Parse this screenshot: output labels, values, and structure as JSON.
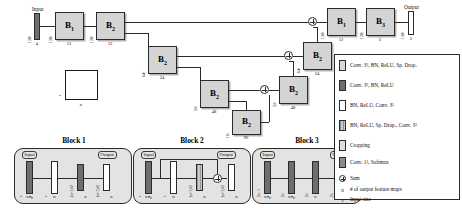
{
  "diagram": {
    "input_label": "Input",
    "output_label": "Output",
    "scale_box": {
      "size_label": "s",
      "maps_label": "n"
    }
  },
  "encoder": {
    "input_bar": {
      "size": "128³",
      "maps": "4"
    },
    "nodes": [
      {
        "name": "B",
        "sub": "1",
        "size": "128³",
        "maps": "12"
      },
      {
        "name": "B",
        "sub": "2",
        "size": "128³",
        "maps": "12"
      },
      {
        "name": "B",
        "sub": "2",
        "size": "64³",
        "maps": "24"
      },
      {
        "name": "B",
        "sub": "2",
        "size": "32³",
        "maps": "48"
      },
      {
        "name": "B",
        "sub": "2",
        "size": "16³",
        "maps": "96"
      }
    ]
  },
  "decoder": {
    "nodes": [
      {
        "name": "B",
        "sub": "2",
        "size": "32³",
        "maps": "48"
      },
      {
        "name": "B",
        "sub": "2",
        "size": "64³",
        "maps": "24"
      },
      {
        "name": "B",
        "sub": "1",
        "size": "128³",
        "maps": "12"
      },
      {
        "name": "B",
        "sub": "3",
        "size": "128³",
        "maps": "2"
      }
    ],
    "output_bar": {
      "size": "128³",
      "maps": "2"
    }
  },
  "blocks": [
    {
      "title": "Block 1",
      "input_tag": "Input",
      "output_tag": "Output",
      "bars": [
        {
          "style": "dark",
          "size": "s",
          "maps": "nₙₚ"
        },
        {
          "style": "white",
          "size": "s",
          "maps": "n"
        },
        {
          "style": "dark",
          "size": "(s+1)/2",
          "maps": "n"
        },
        {
          "style": "white",
          "size": "(s+1)/2",
          "maps": "n"
        }
      ],
      "has_skip": false,
      "has_sum": false
    },
    {
      "title": "Block 2",
      "input_tag": "Input",
      "output_tag": "Output",
      "bars": [
        {
          "style": "dark",
          "size": "s",
          "maps": "nₙₚ"
        },
        {
          "style": "white",
          "size": "s",
          "maps": "n"
        },
        {
          "style": "hatch",
          "size": "(s+1)/2",
          "maps": "n"
        },
        {
          "style": "white",
          "size": "(s+1)/2",
          "maps": "n"
        }
      ],
      "has_skip": true,
      "has_sum": true
    },
    {
      "title": "Block 3",
      "input_tag": "Input",
      "output_tag": "Output",
      "bars": [
        {
          "style": "dark",
          "size": "2s−1",
          "maps": "nₙₚ"
        },
        {
          "style": "dark",
          "size": "2s",
          "maps": "nₙₚ"
        },
        {
          "style": "dark",
          "size": "2s",
          "maps": "n"
        },
        {
          "style": "white",
          "size": "2s",
          "maps": "n"
        }
      ],
      "has_skip": false,
      "has_sum": false
    }
  ],
  "legend": {
    "items": [
      {
        "swatch": "l1",
        "text": "Conv. 3³, BN, ReLU, Sp. Drop."
      },
      {
        "swatch": "l2",
        "text": "Conv. 3³, BN, ReLU"
      },
      {
        "swatch": "l3",
        "text": "BN, ReLU, Conv. 3³"
      },
      {
        "swatch": "l4",
        "text": "BN, ReLU, Sp. Drop., Conv. 3³"
      },
      {
        "swatch": "l5",
        "text": "Cropping"
      },
      {
        "swatch": "l6",
        "text": "Conv. 1³, Softmax"
      }
    ],
    "sum_text": "Sum",
    "symbols": [
      {
        "sym": "n",
        "text": "# of output feature maps"
      },
      {
        "sym": "s",
        "text": "Input size"
      }
    ]
  },
  "colors": {
    "block_fill": "#d4d4d4",
    "panel_fill": "#e3e3e3",
    "bar_dark": "#6e6e6e",
    "bar_light": "#d8d8d8",
    "line": "#2b2b2b"
  }
}
